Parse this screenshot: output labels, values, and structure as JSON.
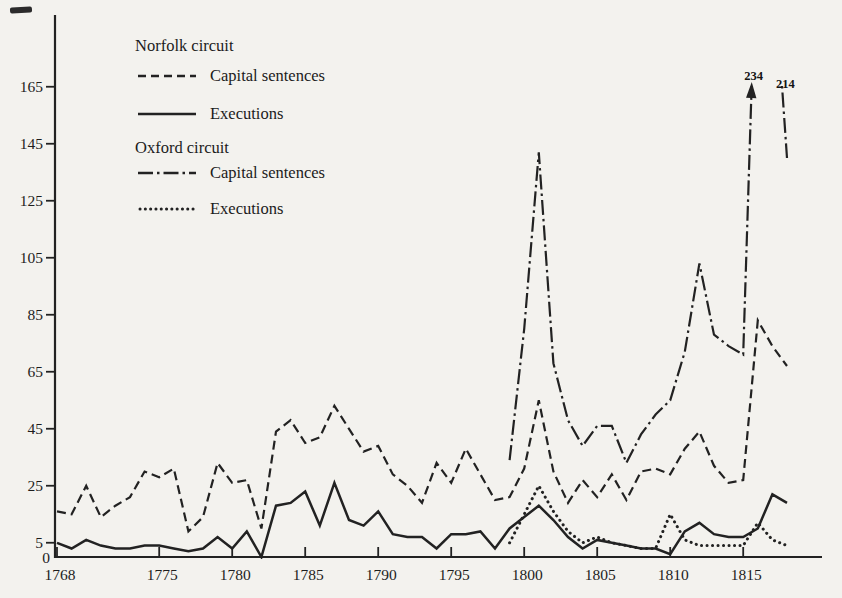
{
  "page": {
    "background": "#f3f2ee",
    "ink": "#222222"
  },
  "legend": {
    "norfolk": {
      "title": "Norfolk circuit",
      "items": [
        {
          "label": "Capital sentences",
          "style": "dashed"
        },
        {
          "label": "Executions",
          "style": "solid"
        }
      ]
    },
    "oxford": {
      "title": "Oxford circuit",
      "items": [
        {
          "label": "Capital sentences",
          "style": "dashdot"
        },
        {
          "label": "Executions",
          "style": "dotted"
        }
      ]
    }
  },
  "chart_data": {
    "type": "line",
    "title": "",
    "xlabel": "",
    "ylabel": "",
    "grid": false,
    "legend_position": "top-left",
    "x_axis": {
      "min": 1768,
      "max": 1820,
      "ticks": [
        1768,
        1775,
        1780,
        1785,
        1790,
        1795,
        1800,
        1805,
        1810,
        1815
      ]
    },
    "y_axis": {
      "min": 0,
      "max": 190,
      "ticks": [
        0,
        5,
        25,
        45,
        65,
        85,
        105,
        125,
        145,
        165
      ]
    },
    "series": [
      {
        "id": "norfolk_sentences",
        "name": "Norfolk circuit — Capital sentences",
        "style": "dashed",
        "start_year": 1768,
        "values": [
          16,
          15,
          25,
          14,
          18,
          21,
          30,
          28,
          31,
          9,
          14,
          33,
          26,
          27,
          10,
          44,
          48,
          40,
          42,
          53,
          45,
          37,
          39,
          29,
          25,
          19,
          33,
          26,
          38,
          29,
          20,
          21,
          31,
          55,
          30,
          19,
          27,
          21,
          29,
          20,
          30,
          31,
          29,
          38,
          44,
          32,
          26,
          27,
          83,
          74,
          67
        ]
      },
      {
        "id": "norfolk_executions",
        "name": "Norfolk circuit — Executions",
        "style": "solid",
        "start_year": 1768,
        "values": [
          5,
          3,
          6,
          4,
          3,
          3,
          4,
          4,
          3,
          2,
          3,
          7,
          3,
          9,
          0,
          18,
          19,
          23,
          11,
          26,
          13,
          11,
          16,
          8,
          7,
          7,
          3,
          8,
          8,
          9,
          3,
          10,
          14,
          18,
          13,
          7,
          3,
          6,
          5,
          4,
          3,
          3,
          1,
          9,
          12,
          8,
          7,
          7,
          10,
          22,
          19
        ]
      },
      {
        "id": "oxford_sentences",
        "name": "Oxford circuit — Capital sentences",
        "style": "dashdot",
        "start_year": 1799,
        "values": [
          34,
          80,
          142,
          68,
          48,
          39,
          46,
          46,
          33,
          43,
          50,
          55,
          72,
          103,
          78,
          74,
          71,
          234,
          214,
          140
        ]
      },
      {
        "id": "oxford_executions",
        "name": "Oxford circuit — Executions",
        "style": "dotted",
        "start_year": 1799,
        "values": [
          5,
          15,
          25,
          16,
          9,
          5,
          7,
          5,
          4,
          3,
          3,
          15,
          6,
          4,
          4,
          4,
          4,
          12,
          6,
          4
        ]
      }
    ],
    "annotations": [
      {
        "text": "234",
        "series": "oxford_sentences",
        "year": 1816,
        "value": 234,
        "arrow": true
      },
      {
        "text": "214",
        "series": "oxford_sentences",
        "year": 1817,
        "value": 214,
        "arrow": false
      }
    ]
  }
}
